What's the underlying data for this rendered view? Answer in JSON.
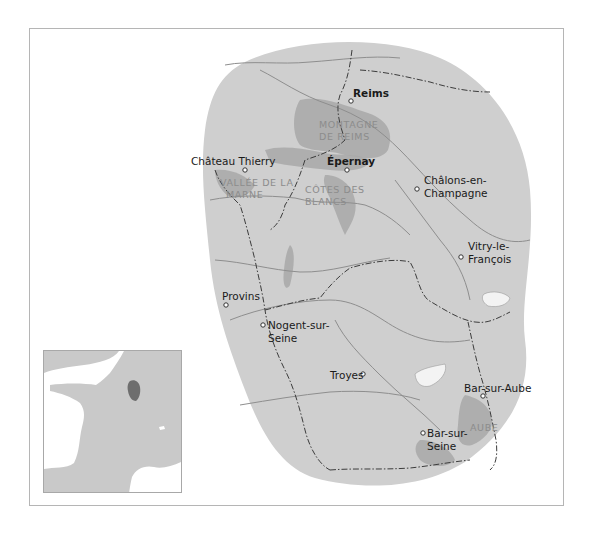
{
  "map": {
    "title": "Champagne wine region",
    "colors": {
      "background": "#ffffff",
      "region_fill": "#cfcfcf",
      "vineyard_fill": "#a8a8a8",
      "river": "#8e8e8e",
      "border": "#3c3c3c",
      "region_label": "#8c8c8c",
      "town_label": "#1a1a1a",
      "inset_land": "#c9c9c9",
      "inset_highlight": "#6e6e6e"
    },
    "towns": [
      {
        "name": "Reims",
        "bold": true,
        "x": 351,
        "y": 101,
        "label_x": 353,
        "label_y": 97
      },
      {
        "name": "Épernay",
        "bold": true,
        "x": 347,
        "y": 170,
        "label_x": 327,
        "label_y": 165
      },
      {
        "name": "Château Thierry",
        "bold": false,
        "x": 245,
        "y": 170,
        "label_x": 191,
        "label_y": 165
      },
      {
        "name": "Provins",
        "bold": false,
        "x": 226,
        "y": 305,
        "label_x": 223,
        "label_y": 300
      },
      {
        "name": "Troyes",
        "bold": false,
        "x": 363,
        "y": 374,
        "label_x": 330,
        "label_y": 379
      },
      {
        "name": "Bar-sur-Aube",
        "bold": false,
        "x": 483,
        "y": 396,
        "label_x": 464,
        "label_y": 392
      },
      {
        "name": "Bar-sur-Seine",
        "bold": false,
        "x": 423,
        "y": 433,
        "label_x": 427,
        "label_y": 437
      }
    ],
    "multiline_towns": [
      {
        "lines": [
          "Châlons-en-",
          "Champagne"
        ],
        "x": 417,
        "y": 189,
        "label_x": 424,
        "label_y": 184
      },
      {
        "lines": [
          "Vitry-le-",
          "François"
        ],
        "x": 461,
        "y": 257,
        "label_x": 468,
        "label_y": 250
      },
      {
        "lines": [
          "Nogent-sur-",
          "Seine"
        ],
        "x": 263,
        "y": 325,
        "label_x": 268,
        "label_y": 329
      }
    ],
    "regions": [
      {
        "lines": [
          "MONTAGNE",
          "DE REIMS"
        ],
        "x": 319,
        "y": 128
      },
      {
        "lines": [
          "VALLÉE DE LA",
          "MARNE"
        ],
        "x": 220,
        "y": 186
      },
      {
        "lines": [
          "CÔTES DES",
          "BLANCS"
        ],
        "x": 305,
        "y": 193
      },
      {
        "lines": [
          "AUBE"
        ],
        "x": 470,
        "y": 431
      }
    ]
  },
  "inset": {
    "caption": "France locator",
    "highlight_label": "Champagne"
  }
}
